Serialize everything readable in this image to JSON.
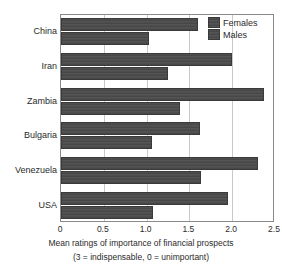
{
  "chart_data": {
    "type": "bar",
    "orientation": "horizontal",
    "title": "",
    "xlabel": "Mean ratings of importance of financial prospects",
    "xlabel_note": "(3 = indispensable, 0 = unimportant)",
    "ylabel": "",
    "categories": [
      "China",
      "Iran",
      "Zambia",
      "Bulgaria",
      "Venezuela",
      "USA"
    ],
    "series": [
      {
        "name": "Females",
        "values": [
          1.6,
          2.0,
          2.37,
          1.62,
          2.3,
          1.95
        ]
      },
      {
        "name": "Males",
        "values": [
          1.03,
          1.25,
          1.39,
          1.06,
          1.64,
          1.08
        ]
      }
    ],
    "xlim": [
      0,
      2.5
    ],
    "xticks": [
      0,
      0.5,
      1.0,
      1.5,
      2.0,
      2.5
    ],
    "xticklabels": [
      "0",
      "0.5",
      "1.0",
      "1.5",
      "2.0",
      "2.5"
    ],
    "grid": true,
    "grid_axis": "x",
    "legend_position": "top-right",
    "bar_color": "#4e4e4e",
    "bar_edge_color": "#3a3a3a",
    "grid_color": "#c9c9c9",
    "axis_color": "#8a8a8a",
    "background": "#ffffff",
    "text_color": "#2b2b2b"
  },
  "legend": {
    "entries": [
      {
        "label": "Females"
      },
      {
        "label": "Males"
      }
    ]
  }
}
